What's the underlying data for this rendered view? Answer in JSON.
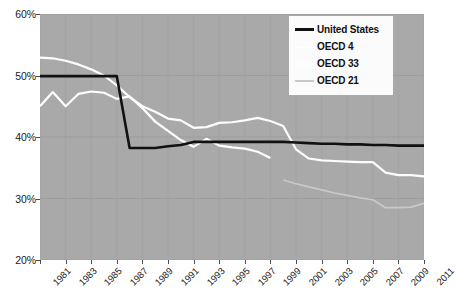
{
  "chart_data": {
    "type": "line",
    "title": "",
    "subtitle": "",
    "xlabel": "",
    "ylabel": "",
    "grid": true,
    "legend_position": "top-right",
    "plot_background": "#a9a9a9",
    "xlim": [
      1981,
      2011
    ],
    "ylim": [
      20,
      60
    ],
    "y_ticks": [
      60,
      50,
      40,
      30,
      20
    ],
    "y_tick_labels": [
      "60%",
      "50%",
      "40%",
      "30%",
      "20%"
    ],
    "x_ticks": [
      1981,
      1983,
      1985,
      1987,
      1989,
      1991,
      1993,
      1995,
      1997,
      1999,
      2001,
      2003,
      2005,
      2007,
      2009,
      2011
    ],
    "x_tick_labels": [
      "1981",
      "1983",
      "1985",
      "1987",
      "1989",
      "1991",
      "1993",
      "1995",
      "1997",
      "1999",
      "2001",
      "2003",
      "2005",
      "2007",
      "2009",
      "2011"
    ],
    "x": [
      1981,
      1982,
      1983,
      1984,
      1985,
      1986,
      1987,
      1988,
      1989,
      1990,
      1991,
      1992,
      1993,
      1994,
      1995,
      1996,
      1997,
      1998,
      1999,
      2000,
      2001,
      2002,
      2003,
      2004,
      2005,
      2006,
      2007,
      2008,
      2009,
      2010,
      2011
    ],
    "series": [
      {
        "name": "United States",
        "color": "#111111",
        "width": 2.6,
        "x": [
          1981,
          1982,
          1983,
          1984,
          1985,
          1986,
          1987,
          1988,
          1989,
          1990,
          1991,
          1992,
          1993,
          1994,
          1995,
          1996,
          1997,
          1998,
          1999,
          2000,
          2001,
          2002,
          2003,
          2004,
          2005,
          2006,
          2007,
          2008,
          2009,
          2010,
          2011
        ],
        "values": [
          49.9,
          49.9,
          49.9,
          49.9,
          49.9,
          49.9,
          49.9,
          38.2,
          38.2,
          38.2,
          38.5,
          38.7,
          39.2,
          39.2,
          39.2,
          39.2,
          39.2,
          39.2,
          39.2,
          39.2,
          39.1,
          39.0,
          38.9,
          38.9,
          38.8,
          38.8,
          38.7,
          38.7,
          38.6,
          38.6,
          38.6
        ]
      },
      {
        "name": "OECD 4",
        "color": "#ffffff",
        "width": 2.2,
        "x": [
          1981,
          1982,
          1983,
          1984,
          1985,
          1986,
          1987,
          1988,
          1989,
          1990,
          1991,
          1992,
          1993,
          1994,
          1995,
          1996,
          1997,
          1998,
          1999
        ],
        "values": [
          45.0,
          47.3,
          45.0,
          47.0,
          47.4,
          47.2,
          46.2,
          46.6,
          44.7,
          42.5,
          41.0,
          39.5,
          38.4,
          39.7,
          38.6,
          38.3,
          38.1,
          37.6,
          36.6
        ]
      },
      {
        "name": "OECD 33",
        "color": "#fdfdfd",
        "width": 2.2,
        "x": [
          1981,
          1982,
          1983,
          1984,
          1985,
          1986,
          1987,
          1988,
          1989,
          1990,
          1991,
          1992,
          1993,
          1994,
          1995,
          1996,
          1997,
          1998,
          1999,
          2000,
          2001,
          2002,
          2003,
          2004,
          2005,
          2006,
          2007,
          2008,
          2009,
          2010,
          2011
        ],
        "values": [
          52.9,
          52.8,
          52.4,
          51.8,
          51.0,
          50.0,
          48.4,
          46.5,
          45.0,
          44.1,
          43.0,
          42.7,
          41.5,
          41.6,
          42.3,
          42.4,
          42.7,
          43.1,
          42.6,
          41.8,
          38.0,
          36.5,
          36.2,
          36.1,
          36.0,
          35.9,
          35.9,
          34.2,
          33.8,
          33.8,
          33.6
        ]
      },
      {
        "name": "OECD 21",
        "color": "#c9c9c9",
        "width": 1.7,
        "x": [
          2000,
          2001,
          2002,
          2003,
          2004,
          2005,
          2006,
          2007,
          2008,
          2009,
          2010,
          2011
        ],
        "values": [
          33.0,
          32.4,
          31.9,
          31.4,
          30.9,
          30.5,
          30.1,
          29.8,
          28.5,
          28.5,
          28.6,
          29.2
        ]
      }
    ]
  },
  "legend": {
    "entries": [
      {
        "label": "United States"
      },
      {
        "label": "OECD 4"
      },
      {
        "label": "OECD 33"
      },
      {
        "label": "OECD 21"
      }
    ]
  }
}
